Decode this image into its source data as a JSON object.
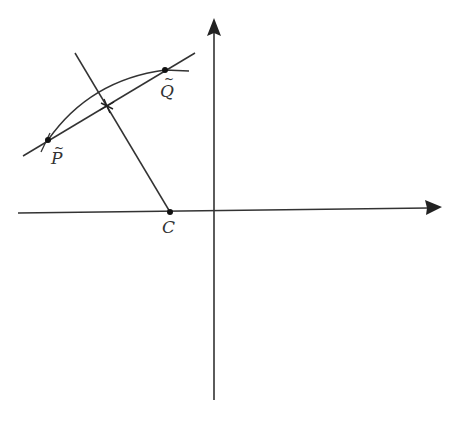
{
  "diagram": {
    "type": "geometry",
    "colors": {
      "stroke": "#333333",
      "background": "#ffffff"
    },
    "points": {
      "P": {
        "label": "P",
        "accent": "~",
        "x": 48,
        "y": 140
      },
      "Q": {
        "label": "Q",
        "accent": "~",
        "x": 165,
        "y": 70
      },
      "C": {
        "label": "C",
        "x": 170,
        "y": 212
      },
      "midpoint": {
        "label": "",
        "x": 107,
        "y": 106
      }
    },
    "axes": {
      "origin_x": 215,
      "origin_y": 213
    }
  }
}
